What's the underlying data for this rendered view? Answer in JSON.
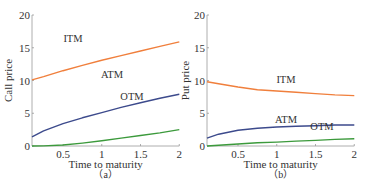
{
  "chart_data": [
    {
      "type": "line",
      "panel_label": "(a)",
      "title": "",
      "xlabel": "Time to maturity",
      "ylabel": "Call price",
      "xlim": [
        0.1,
        2
      ],
      "ylim": [
        0,
        20
      ],
      "xticks": [
        "0.5",
        "1",
        "1.5",
        "2"
      ],
      "yticks": [
        "0",
        "5",
        "10",
        "15",
        "20"
      ],
      "grid": false,
      "x": [
        0.1,
        0.25,
        0.5,
        0.75,
        1,
        1.25,
        1.5,
        1.75,
        2
      ],
      "series": [
        {
          "name": "ITM",
          "color": "#f07f3c",
          "values": [
            10.1,
            10.6,
            11.5,
            12.3,
            13.1,
            13.8,
            14.5,
            15.2,
            15.9
          ]
        },
        {
          "name": "ATM",
          "color": "#3c4a8c",
          "values": [
            1.4,
            2.3,
            3.4,
            4.3,
            5.1,
            5.9,
            6.6,
            7.3,
            7.9
          ]
        },
        {
          "name": "OTM",
          "color": "#3c9a3c",
          "values": [
            0.0,
            0.02,
            0.15,
            0.45,
            0.8,
            1.2,
            1.6,
            2.0,
            2.5
          ]
        }
      ],
      "annotations": [
        "ITM",
        "ATM",
        "OTM"
      ]
    },
    {
      "type": "line",
      "panel_label": "(b)",
      "title": "",
      "xlabel": "Time to maturity",
      "ylabel": "Put price",
      "xlim": [
        0.1,
        2
      ],
      "ylim": [
        0,
        20
      ],
      "xticks": [
        "0.5",
        "1",
        "1.5",
        "2"
      ],
      "yticks": [
        "0",
        "5",
        "10",
        "15",
        "20"
      ],
      "grid": false,
      "x": [
        0.1,
        0.25,
        0.5,
        0.75,
        1,
        1.25,
        1.5,
        1.75,
        2
      ],
      "series": [
        {
          "name": "ITM",
          "color": "#f07f3c",
          "values": [
            9.8,
            9.5,
            9.0,
            8.6,
            8.4,
            8.2,
            8.0,
            7.8,
            7.7
          ]
        },
        {
          "name": "ATM",
          "color": "#3c4a8c",
          "values": [
            1.2,
            1.8,
            2.4,
            2.7,
            2.9,
            3.0,
            3.1,
            3.2,
            3.2
          ]
        },
        {
          "name": "OTM",
          "color": "#3c9a3c",
          "values": [
            0.0,
            0.1,
            0.3,
            0.5,
            0.6,
            0.75,
            0.85,
            1.0,
            1.1
          ]
        }
      ],
      "annotations": [
        "ITM",
        "ATM",
        "OTM"
      ]
    }
  ],
  "figure": {
    "panel_a": {
      "ylabel": "Call price",
      "xlabel": "Time to maturity",
      "label": "（a）"
    },
    "panel_b": {
      "ylabel": "Put price",
      "xlabel": "Time to maturity",
      "label": "（b）"
    }
  }
}
